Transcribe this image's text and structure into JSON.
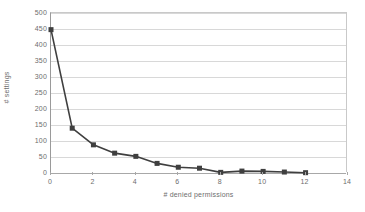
{
  "chart_data": {
    "type": "line",
    "title": "",
    "xlabel": "# denied permissions",
    "ylabel": "# settings",
    "xlim": [
      0,
      14
    ],
    "ylim": [
      0,
      500
    ],
    "x_ticks": [
      0,
      2,
      4,
      6,
      8,
      10,
      12,
      14
    ],
    "y_ticks": [
      0,
      50,
      100,
      150,
      200,
      250,
      300,
      350,
      400,
      450,
      500
    ],
    "grid": "horizontal",
    "legend": "none",
    "x": [
      0,
      1,
      2,
      3,
      4,
      5,
      6,
      7,
      8,
      9,
      10,
      11,
      12
    ],
    "values": [
      448,
      140,
      88,
      62,
      52,
      30,
      18,
      15,
      2,
      6,
      5,
      3,
      1
    ],
    "series": [
      {
        "name": "# settings",
        "x": [
          0,
          1,
          2,
          3,
          4,
          5,
          6,
          7,
          8,
          9,
          10,
          11,
          12
        ],
        "values": [
          448,
          140,
          88,
          62,
          52,
          30,
          18,
          15,
          2,
          6,
          5,
          3,
          1
        ]
      }
    ],
    "marker": "square",
    "line_color": "#3f3f3f",
    "marker_color": "#3f3f3f",
    "grid_color": "#d8d8d8",
    "axis_color": "#a8a8a8",
    "text_color": "#6d6d6d",
    "background": "#ffffff"
  }
}
